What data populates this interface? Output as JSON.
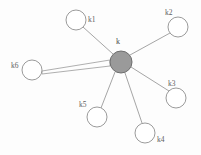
{
  "figure": {
    "type": "star-graph",
    "background_color": "#fdfdfd",
    "width": 201,
    "height": 155
  },
  "center_node": {
    "id": "k",
    "label": "k",
    "cx": 121,
    "cy": 62,
    "r": 11,
    "fill": "#9a9a9a",
    "stroke": "#6e6e6e",
    "label_x": 116,
    "label_y": 38
  },
  "leaf_nodes": [
    {
      "id": "k1",
      "label": "k1",
      "cx": 76,
      "cy": 20,
      "r": 10,
      "fill": "#ffffff",
      "stroke": "#8f8f8f",
      "label_x": 88,
      "label_y": 16
    },
    {
      "id": "k2",
      "label": "k2",
      "cx": 178,
      "cy": 27,
      "r": 10,
      "fill": "#ffffff",
      "stroke": "#8f8f8f",
      "label_x": 165,
      "label_y": 9
    },
    {
      "id": "k3",
      "label": "k3",
      "cx": 176,
      "cy": 98,
      "r": 10,
      "fill": "#ffffff",
      "stroke": "#8f8f8f",
      "label_x": 168,
      "label_y": 80
    },
    {
      "id": "k4",
      "label": "k4",
      "cx": 145,
      "cy": 133,
      "r": 10,
      "fill": "#ffffff",
      "stroke": "#8f8f8f",
      "label_x": 157,
      "label_y": 136
    },
    {
      "id": "k5",
      "label": "k5",
      "cx": 97,
      "cy": 117,
      "r": 10,
      "fill": "#ffffff",
      "stroke": "#8f8f8f",
      "label_x": 79,
      "label_y": 101
    },
    {
      "id": "k6",
      "label": "k6",
      "cx": 32,
      "cy": 70,
      "r": 10,
      "fill": "#ffffff",
      "stroke": "#8f8f8f",
      "label_x": 11,
      "label_y": 62
    }
  ],
  "edges": [
    {
      "id": "edge-k-k1",
      "from": "k",
      "to": "k1",
      "x1": 113,
      "y1": 54,
      "x2": 83,
      "y2": 27,
      "style": "line",
      "stroke": "#9b9b9b",
      "width": 0.9
    },
    {
      "id": "edge-k-k2",
      "from": "k",
      "to": "k2",
      "x1": 130,
      "y1": 55,
      "x2": 170,
      "y2": 33,
      "style": "line",
      "stroke": "#9b9b9b",
      "width": 0.9
    },
    {
      "id": "edge-k-k3",
      "from": "k",
      "to": "k3",
      "x1": 131,
      "y1": 67,
      "x2": 169,
      "y2": 91,
      "style": "line",
      "stroke": "#9b9b9b",
      "width": 0.9
    },
    {
      "id": "edge-k-k4",
      "from": "k",
      "to": "k4",
      "x1": 125,
      "y1": 73,
      "x2": 142,
      "y2": 123,
      "style": "line",
      "stroke": "#9b9b9b",
      "width": 0.9
    },
    {
      "id": "edge-k-k5",
      "from": "k",
      "to": "k5",
      "x1": 115,
      "y1": 72,
      "x2": 101,
      "y2": 108,
      "style": "line",
      "stroke": "#9b9b9b",
      "width": 0.9
    },
    {
      "id": "edge-k-k6",
      "from": "k",
      "to": "k6",
      "x1": 110,
      "y1": 64,
      "x2": 42,
      "y2": 72,
      "style": "wedge",
      "stroke": "#9b9b9b",
      "width": 0.8
    }
  ]
}
